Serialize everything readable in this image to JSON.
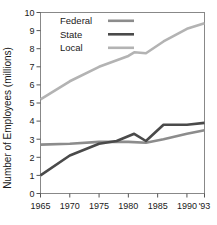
{
  "chart_data": {
    "type": "line",
    "title": "",
    "subtitle": "",
    "xlabel": "",
    "ylabel": "Number of Employees (millions)",
    "xlim": [
      1965,
      1993
    ],
    "ylim": [
      0,
      10
    ],
    "grid": false,
    "legend_position": "top-left-inside",
    "x_tick_labels": [
      "1965",
      "1970",
      "1975",
      "1980",
      "1985",
      "1990",
      "'93"
    ],
    "x_tick_values": [
      1965,
      1970,
      1975,
      1980,
      1985,
      1990,
      1993
    ],
    "y_tick_labels": [
      "0",
      "1",
      "2",
      "3",
      "4",
      "5",
      "6",
      "7",
      "8",
      "9",
      "10"
    ],
    "y_tick_values": [
      0,
      1,
      2,
      3,
      4,
      5,
      6,
      7,
      8,
      9,
      10
    ],
    "series": [
      {
        "name": "Federal",
        "color": "#8c8c8c",
        "stroke_width": 2.6,
        "x": [
          1965,
          1970,
          1975,
          1980,
          1983,
          1986,
          1990,
          1993
        ],
        "values": [
          2.7,
          2.75,
          2.85,
          2.85,
          2.8,
          3.0,
          3.3,
          3.5
        ]
      },
      {
        "name": "State",
        "color": "#4a4a4a",
        "stroke_width": 2.6,
        "x": [
          1965,
          1970,
          1975,
          1978,
          1981,
          1983,
          1986,
          1990,
          1993
        ],
        "values": [
          1.0,
          2.1,
          2.75,
          2.9,
          3.3,
          2.9,
          3.8,
          3.8,
          3.9
        ]
      },
      {
        "name": "Local",
        "color": "#b3b3b3",
        "stroke_width": 2.6,
        "x": [
          1965,
          1970,
          1975,
          1980,
          1981,
          1983,
          1986,
          1990,
          1993
        ],
        "values": [
          5.2,
          6.2,
          7.0,
          7.6,
          7.8,
          7.75,
          8.4,
          9.1,
          9.4
        ]
      }
    ]
  },
  "legend": {
    "items": [
      {
        "label": "Federal",
        "swatch_name": "legend-swatch-federal"
      },
      {
        "label": "State",
        "swatch_name": "legend-swatch-state"
      },
      {
        "label": "Local",
        "swatch_name": "legend-swatch-local"
      }
    ]
  },
  "axes": {
    "y_axis_title": "Number of Employees (millions)"
  }
}
